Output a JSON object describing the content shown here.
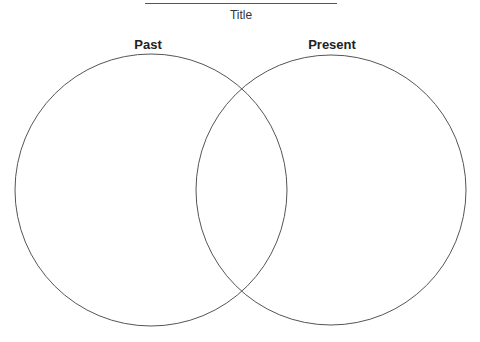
{
  "title": "Title",
  "sets": [
    {
      "label": "Past",
      "cx": 151,
      "cy": 190,
      "r": 136
    },
    {
      "label": "Present",
      "cx": 331,
      "cy": 190,
      "r": 135
    }
  ],
  "colors": {
    "stroke": "#555555",
    "background": "#ffffff"
  }
}
